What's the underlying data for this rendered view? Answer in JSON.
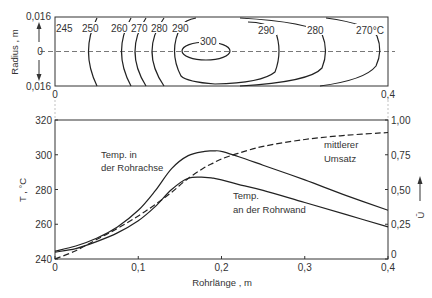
{
  "chart_data": [
    {
      "type": "contour",
      "title": "",
      "xlabel": "",
      "ylabel": "Radius , m",
      "xlim": [
        0,
        0.4
      ],
      "ylim": [
        -0.016,
        0.016
      ],
      "x_ticks": [
        "0",
        "0,4"
      ],
      "y_ticks": [
        "0,016",
        "0",
        "0,016"
      ],
      "contour_levels": [
        "245",
        "250",
        "260",
        "270",
        "280",
        "290",
        "300",
        "290",
        "280",
        "270°C"
      ],
      "contours": [
        {
          "level": 245,
          "label": "245"
        },
        {
          "level": 250,
          "label": "250",
          "x_at_axis": 0.034
        },
        {
          "level": 260,
          "label": "260",
          "x_at_axis": 0.068
        },
        {
          "level": 270,
          "label": "270",
          "x_at_axis": 0.085
        },
        {
          "level": 280,
          "label": "280",
          "x_at_axis": 0.1
        },
        {
          "level": 290,
          "label": "290",
          "x_at_axis_in": 0.115,
          "x_at_axis_out": 0.28
        },
        {
          "level": 300,
          "label": "300",
          "x_at_axis_in": 0.166,
          "x_at_axis_out": 0.22
        },
        {
          "level": 280,
          "label": "280",
          "x_at_axis_out": 0.33
        },
        {
          "level": 270,
          "label": "270°C",
          "x_at_axis_out": 0.383
        }
      ],
      "grid": false
    },
    {
      "type": "line",
      "title": "",
      "xlabel": "Rohrlänge , m",
      "ylabel": "T , °C",
      "y2label": "Ū",
      "xlim": [
        0,
        0.4
      ],
      "ylim": [
        240,
        320
      ],
      "y2lim": [
        0,
        1.0
      ],
      "x_ticks": [
        "0",
        "0,1",
        "0,2",
        "0,3",
        "0,4"
      ],
      "y_ticks": [
        "240",
        "260",
        "280",
        "300",
        "320"
      ],
      "y2_ticks": [
        "0",
        "0,25",
        "0,50",
        "0,75",
        "1,00"
      ],
      "x": [
        0,
        0.025,
        0.05,
        0.075,
        0.1,
        0.12,
        0.14,
        0.16,
        0.18,
        0.19,
        0.2,
        0.22,
        0.25,
        0.3,
        0.35,
        0.4
      ],
      "series": [
        {
          "name": "Temp. in der Rohrachse",
          "axis": "left",
          "style": "solid",
          "values": [
            244.5,
            247.5,
            252,
            258.5,
            268,
            279,
            292,
            299.5,
            302,
            302.2,
            302,
            299,
            294,
            285.5,
            276.5,
            268
          ]
        },
        {
          "name": "Temp. an der Rohrwand",
          "axis": "left",
          "style": "solid",
          "values": [
            244,
            246,
            250,
            255,
            262,
            270,
            280,
            286.5,
            287,
            286.5,
            285.5,
            283,
            279.5,
            272.5,
            265.5,
            258.5
          ]
        },
        {
          "name": "mittlerer Umsatz",
          "axis": "right",
          "style": "dashed",
          "values": [
            0.0,
            0.06,
            0.14,
            0.22,
            0.31,
            0.39,
            0.48,
            0.58,
            0.66,
            0.69,
            0.72,
            0.76,
            0.81,
            0.86,
            0.89,
            0.91
          ]
        }
      ],
      "annotations": [
        {
          "text": "Temp. in",
          "x": 0.055,
          "y": 300
        },
        {
          "text": "der Rohrachse",
          "x": 0.055,
          "y": 293
        },
        {
          "text": "Temp.",
          "x": 0.215,
          "y": 278
        },
        {
          "text": "an der Rohrwand",
          "x": 0.215,
          "y": 271
        },
        {
          "text": "mittlerer",
          "x": 0.335,
          "y": 308
        },
        {
          "text": "Umsatz",
          "x": 0.335,
          "y": 301
        }
      ],
      "grid": false,
      "legend": "none (inline annotations)"
    }
  ],
  "upper": {
    "ylabel": "Radius , m",
    "y_top": "0,016",
    "y_mid": "0",
    "y_bot": "0,016",
    "x_left": "0",
    "x_right": "0,4",
    "labels": [
      "245",
      "250",
      "260",
      "270",
      "280",
      "290",
      "300",
      "290",
      "280",
      "270°C"
    ]
  },
  "lower": {
    "xlabel": "Rohrlänge , m",
    "ylabel": "T , °C",
    "y2label": "Ū",
    "x_ticks": [
      "0",
      "0,1",
      "0,2",
      "0,3",
      "0,4"
    ],
    "y_ticks": [
      "240",
      "260",
      "280",
      "300",
      "320"
    ],
    "y2_ticks": [
      "0",
      "0,25",
      "0,50",
      "0,75",
      "1,00"
    ],
    "ann_axis_1": "Temp. in",
    "ann_axis_2": "der Rohrachse",
    "ann_wall_1": "Temp.",
    "ann_wall_2": "an der Rohrwand",
    "ann_conv_1": "mittlerer",
    "ann_conv_2": "Umsatz"
  }
}
